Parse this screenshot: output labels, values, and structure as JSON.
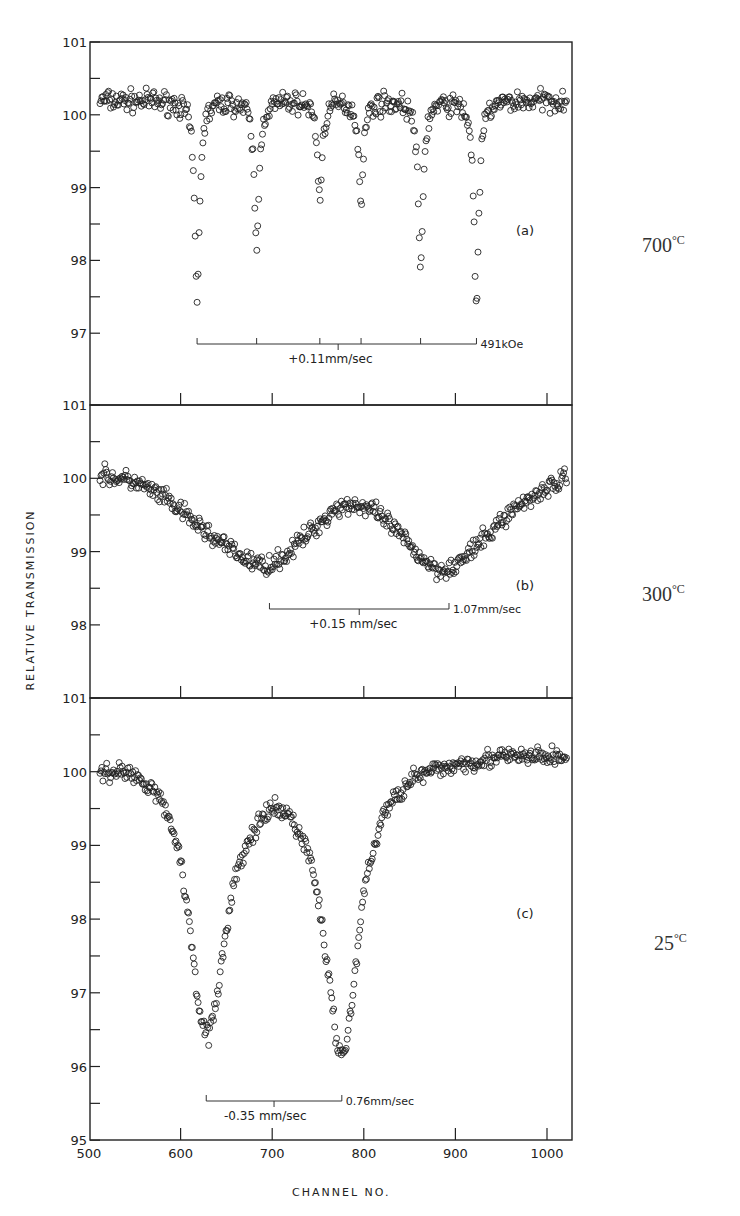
{
  "figure": {
    "y_axis_label": "RELATIVE TRANSMISSION",
    "x_axis_label": "CHANNEL NO.",
    "x_ticks": [
      "500",
      "600",
      "700",
      "800",
      "900",
      "1000"
    ]
  },
  "panels": [
    {
      "id": "a",
      "label": "(a)",
      "temperature": "700",
      "temperature_unit": "°C",
      "y_ticks": [
        "101",
        "100",
        "99",
        "98",
        "97"
      ],
      "annotations": {
        "bracket_right": "491kOe",
        "bracket_center": "+0.11mm/sec"
      }
    },
    {
      "id": "b",
      "label": "(b)",
      "temperature": "300",
      "temperature_unit": "°C",
      "y_ticks": [
        "101",
        "100",
        "99",
        "98"
      ],
      "annotations": {
        "bracket_right": "1.07mm/sec",
        "bracket_center": "+0.15 mm/sec"
      }
    },
    {
      "id": "c",
      "label": "(c)",
      "temperature": "25",
      "temperature_unit": "°C",
      "y_ticks": [
        "101",
        "100",
        "99",
        "98",
        "97",
        "96",
        "95"
      ],
      "annotations": {
        "bracket_right": "0.76mm/sec",
        "bracket_center": "-0.35 mm/sec"
      }
    }
  ],
  "chart_data": [
    {
      "type": "scatter",
      "title": "(a) 700°C",
      "xlabel": "CHANNEL NO.",
      "ylabel": "RELATIVE TRANSMISSION",
      "xlim": [
        500,
        1025
      ],
      "ylim": [
        96.0,
        101
      ],
      "grid": false,
      "description": "Six-line magnetic hyperfine Mossbauer spectrum, hyperfine field 491 kOe, isomer shift +0.11 mm/sec",
      "baseline": 100.2,
      "absorption_lines": [
        {
          "channel": 618,
          "min_transmission": 97.5
        },
        {
          "channel": 683,
          "min_transmission": 98.2
        },
        {
          "channel": 752,
          "min_transmission": 98.9
        },
        {
          "channel": 797,
          "min_transmission": 98.9
        },
        {
          "channel": 862,
          "min_transmission": 97.9
        },
        {
          "channel": 923,
          "min_transmission": 97.4
        }
      ],
      "bracket_ticks_channel": [
        618,
        683,
        752,
        797,
        862,
        923
      ],
      "bracket_center_channel": 772
    },
    {
      "type": "scatter",
      "title": "(b) 300°C",
      "xlabel": "CHANNEL NO.",
      "ylabel": "RELATIVE TRANSMISSION",
      "xlim": [
        500,
        1025
      ],
      "ylim": [
        97.0,
        101
      ],
      "grid": false,
      "description": "Broad quadrupole doublet, splitting 1.07 mm/sec, isomer shift +0.15 mm/sec",
      "x": [
        510,
        550,
        580,
        610,
        640,
        670,
        690,
        710,
        740,
        770,
        790,
        810,
        830,
        860,
        880,
        900,
        930,
        960,
        990,
        1020
      ],
      "y": [
        100.05,
        99.95,
        99.75,
        99.45,
        99.15,
        98.9,
        98.8,
        98.9,
        99.25,
        99.6,
        99.65,
        99.55,
        99.35,
        98.95,
        98.75,
        98.8,
        99.15,
        99.55,
        99.8,
        100.0
      ],
      "absorption_lines": [
        {
          "channel": 697,
          "min_transmission": 98.75
        },
        {
          "channel": 893,
          "min_transmission": 98.75
        }
      ],
      "bracket_ticks_channel": [
        697,
        893
      ],
      "bracket_center_channel": 795
    },
    {
      "type": "scatter",
      "title": "(c) 25°C",
      "xlabel": "CHANNEL NO.",
      "ylabel": "RELATIVE TRANSMISSION",
      "xlim": [
        500,
        1025
      ],
      "ylim": [
        95,
        101
      ],
      "grid": false,
      "description": "Quadrupole doublet, splitting 0.76 mm/sec, isomer shift -0.35 mm/sec",
      "x": [
        510,
        540,
        570,
        590,
        600,
        610,
        620,
        630,
        640,
        650,
        660,
        680,
        700,
        720,
        740,
        750,
        760,
        770,
        780,
        790,
        800,
        820,
        850,
        900,
        950,
        1020
      ],
      "y": [
        100.0,
        100.0,
        99.8,
        99.3,
        98.8,
        97.9,
        96.8,
        96.4,
        96.9,
        97.9,
        98.6,
        99.2,
        99.5,
        99.4,
        98.9,
        98.3,
        97.4,
        96.3,
        96.2,
        97.2,
        98.4,
        99.4,
        99.9,
        100.1,
        100.2,
        100.2
      ],
      "absorption_lines": [
        {
          "channel": 628,
          "min_transmission": 96.2
        },
        {
          "channel": 776,
          "min_transmission": 96.1
        }
      ],
      "bracket_ticks_channel": [
        628,
        776
      ],
      "bracket_center_channel": 702
    }
  ]
}
